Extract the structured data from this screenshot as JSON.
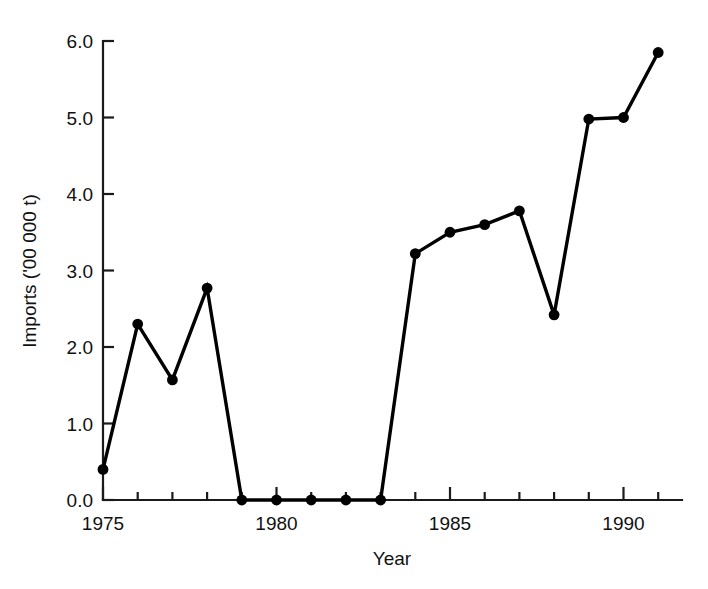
{
  "chart_data": {
    "type": "line",
    "title": "",
    "xlabel": "Year",
    "ylabel": "Imports ('00 000 t)",
    "x": [
      1975,
      1976,
      1977,
      1978,
      1979,
      1980,
      1981,
      1982,
      1983,
      1984,
      1985,
      1986,
      1987,
      1988,
      1989,
      1990,
      1991
    ],
    "values": [
      0.4,
      2.3,
      1.57,
      2.77,
      0.0,
      0.0,
      0.0,
      0.0,
      0.0,
      3.22,
      3.5,
      3.6,
      3.78,
      2.42,
      4.98,
      5.0,
      5.85
    ],
    "series": [
      {
        "name": "Imports",
        "values": [
          0.4,
          2.3,
          1.57,
          2.77,
          0.0,
          0.0,
          0.0,
          0.0,
          0.0,
          3.22,
          3.5,
          3.6,
          3.78,
          2.42,
          4.98,
          5.0,
          5.85
        ]
      }
    ],
    "xlim": [
      1975,
      1991
    ],
    "ylim": [
      0.0,
      6.0
    ],
    "x_tick_values": [
      1975,
      1976,
      1977,
      1978,
      1979,
      1980,
      1981,
      1982,
      1983,
      1984,
      1985,
      1986,
      1987,
      1988,
      1989,
      1990,
      1991
    ],
    "x_tick_labels": [
      "1975",
      "",
      "",
      "",
      "",
      "1980",
      "",
      "",
      "",
      "",
      "1985",
      "",
      "",
      "",
      "",
      "1990",
      ""
    ],
    "y_tick_values": [
      0.0,
      1.0,
      2.0,
      3.0,
      4.0,
      5.0,
      6.0
    ],
    "y_tick_labels": [
      "0.0",
      "1.0",
      "2.0",
      "3.0",
      "4.0",
      "5.0",
      "6.0"
    ],
    "grid": false,
    "legend": "none",
    "marker": "filled-circle",
    "line_color": "#000000",
    "marker_color": "#000000",
    "background_color": "#ffffff"
  }
}
